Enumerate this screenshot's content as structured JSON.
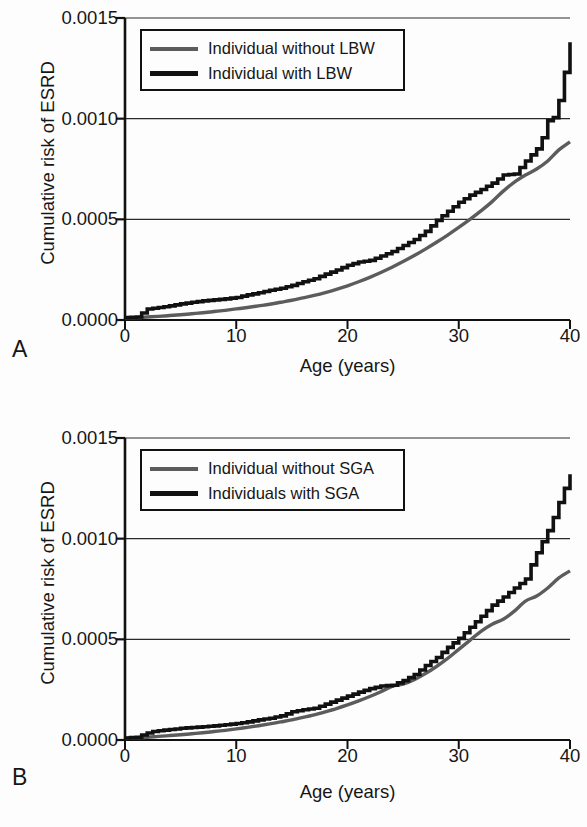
{
  "figure": {
    "panels": [
      {
        "letter": "A",
        "xlabel": "Age (years)",
        "ylabel": "Cumulative risk of ESRD",
        "legend": [
          {
            "label": "Individual without LBW",
            "color": "#5c5c5c",
            "style": "gray"
          },
          {
            "label": "Individual with LBW",
            "color": "#111111",
            "style": "black"
          }
        ]
      },
      {
        "letter": "B",
        "xlabel": "Age (years)",
        "ylabel": "Cumulative risk of ESRD",
        "legend": [
          {
            "label": "Individual without SGA",
            "color": "#5c5c5c",
            "style": "gray"
          },
          {
            "label": "Individuals with SGA",
            "color": "#111111",
            "style": "black"
          }
        ]
      }
    ]
  },
  "chart_data": [
    {
      "type": "line",
      "panel": "A",
      "title": "",
      "xlabel": "Age (years)",
      "ylabel": "Cumulative risk of ESRD",
      "xlim": [
        0,
        40
      ],
      "ylim": [
        0.0,
        0.0015
      ],
      "xticks": [
        0,
        10,
        20,
        30,
        40
      ],
      "yticks": [
        0.0,
        0.0005,
        0.001,
        0.0015
      ],
      "ytick_labels": [
        "0.0000",
        "0.0005",
        "0.0010",
        "0.0015"
      ],
      "xtick_labels": [
        "0",
        "10",
        "20",
        "30",
        "40"
      ],
      "grid": "horizontal",
      "legend_position": "top-left",
      "series": [
        {
          "name": "Individual without LBW",
          "color": "#5c5c5c",
          "step": false,
          "x": [
            0,
            1,
            2,
            3,
            4,
            5,
            6,
            7,
            8,
            9,
            10,
            11,
            12,
            13,
            14,
            15,
            16,
            17,
            18,
            19,
            20,
            21,
            22,
            23,
            24,
            25,
            26,
            27,
            28,
            29,
            30,
            31,
            32,
            33,
            34,
            35,
            36,
            37,
            38,
            39,
            40
          ],
          "y": [
            1e-05,
            1.2e-05,
            1.5e-05,
            1.8e-05,
            2.2e-05,
            2.6e-05,
            3.1e-05,
            3.6e-05,
            4.2e-05,
            4.8e-05,
            5.5e-05,
            6.2e-05,
            7e-05,
            7.8e-05,
            8.8e-05,
            9.8e-05,
            0.00011,
            0.000122,
            0.000136,
            0.000152,
            0.00017,
            0.00019,
            0.000212,
            0.000236,
            0.000262,
            0.00029,
            0.00032,
            0.000352,
            0.000386,
            0.000422,
            0.00046,
            0.0005,
            0.000542,
            0.000588,
            0.00064,
            0.000685,
            0.00072,
            0.00075,
            0.00079,
            0.000845,
            0.000885
          ]
        },
        {
          "name": "Individual with LBW",
          "color": "#111111",
          "step": true,
          "x": [
            0,
            1,
            1.5,
            2,
            2.5,
            3,
            4,
            5,
            6,
            7,
            8,
            9,
            10,
            11,
            12,
            13,
            14,
            15,
            16,
            17,
            18,
            19,
            20,
            21,
            22,
            23,
            24,
            25,
            26,
            27,
            28,
            29,
            30,
            31,
            32,
            33,
            34,
            35,
            36,
            37,
            37.5,
            38,
            38.5,
            39,
            39.5,
            40
          ],
          "y": [
            1.2e-05,
            1.5e-05,
            3.5e-05,
            5.5e-05,
            5.8e-05,
            6.2e-05,
            7e-05,
            8e-05,
            8.8e-05,
            9.5e-05,
            0.0001,
            0.000105,
            0.000112,
            0.000125,
            0.000135,
            0.000148,
            0.000158,
            0.000172,
            0.00019,
            0.000205,
            0.000228,
            0.000248,
            0.000272,
            0.000288,
            0.000296,
            0.000318,
            0.00034,
            0.00037,
            0.0004,
            0.00044,
            0.000495,
            0.00054,
            0.000585,
            0.00062,
            0.000648,
            0.00068,
            0.00072,
            0.000725,
            0.00079,
            0.00085,
            0.000905,
            0.00099,
            0.001005,
            0.00109,
            0.00123,
            0.00138
          ]
        }
      ]
    },
    {
      "type": "line",
      "panel": "B",
      "title": "",
      "xlabel": "Age (years)",
      "ylabel": "Cumulative risk of ESRD",
      "xlim": [
        0,
        40
      ],
      "ylim": [
        0.0,
        0.0015
      ],
      "xticks": [
        0,
        10,
        20,
        30,
        40
      ],
      "yticks": [
        0.0,
        0.0005,
        0.001,
        0.0015
      ],
      "ytick_labels": [
        "0.0000",
        "0.0005",
        "0.0010",
        "0.0015"
      ],
      "xtick_labels": [
        "0",
        "10",
        "20",
        "30",
        "40"
      ],
      "grid": "horizontal",
      "legend_position": "top-left",
      "series": [
        {
          "name": "Individual without SGA",
          "color": "#5c5c5c",
          "step": false,
          "x": [
            0,
            1,
            2,
            3,
            4,
            5,
            6,
            7,
            8,
            9,
            10,
            11,
            12,
            13,
            14,
            15,
            16,
            17,
            18,
            19,
            20,
            21,
            22,
            23,
            24,
            25,
            26,
            27,
            28,
            29,
            30,
            31,
            32,
            33,
            34,
            35,
            36,
            37,
            38,
            39,
            40
          ],
          "y": [
            8e-06,
            1.1e-05,
            1.4e-05,
            1.8e-05,
            2.2e-05,
            2.6e-05,
            3.1e-05,
            3.6e-05,
            4.2e-05,
            4.8e-05,
            5.5e-05,
            6.3e-05,
            7.1e-05,
            8e-05,
            9e-05,
            0.0001,
            0.000112,
            0.000125,
            0.00014,
            0.000156,
            0.000174,
            0.000194,
            0.000216,
            0.00024,
            0.000266,
            0.000278,
            0.0003,
            0.00033,
            0.000365,
            0.000405,
            0.00045,
            0.000495,
            0.00054,
            0.000575,
            0.0006,
            0.00064,
            0.00069,
            0.000715,
            0.000755,
            0.000805,
            0.00084
          ]
        },
        {
          "name": "Individuals with SGA",
          "color": "#111111",
          "step": true,
          "x": [
            0,
            1,
            2,
            2.5,
            3,
            4,
            5,
            6,
            7,
            8,
            9,
            10,
            11,
            12,
            13,
            14,
            15,
            16,
            17,
            18,
            19,
            20,
            21,
            22,
            23,
            24,
            25,
            26,
            27,
            28,
            29,
            30,
            31,
            32,
            33,
            34,
            35,
            36,
            36.5,
            37,
            37.5,
            38,
            38.5,
            39,
            39.5,
            40
          ],
          "y": [
            1e-05,
            1.4e-05,
            3.5e-05,
            4.2e-05,
            4.6e-05,
            5.2e-05,
            5.8e-05,
            6.2e-05,
            6.6e-05,
            7e-05,
            7.6e-05,
            8.2e-05,
            9e-05,
            0.0001,
            0.000108,
            0.00012,
            0.00014,
            0.00015,
            0.000158,
            0.000178,
            0.000198,
            0.000218,
            0.000238,
            0.000255,
            0.000268,
            0.000272,
            0.000295,
            0.000325,
            0.00037,
            0.00041,
            0.00046,
            0.000505,
            0.00056,
            0.000615,
            0.00067,
            0.00071,
            0.000755,
            0.0008,
            0.00087,
            0.00093,
            0.000985,
            0.00104,
            0.001105,
            0.00118,
            0.00125,
            0.00132
          ]
        }
      ]
    }
  ]
}
